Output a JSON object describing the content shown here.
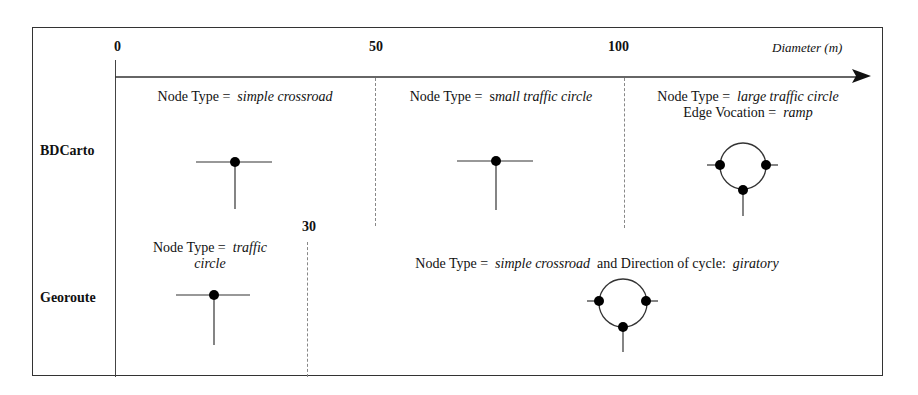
{
  "axis": {
    "title": "Diameter (m)",
    "ticks": [
      {
        "label": "0"
      },
      {
        "label": "50"
      },
      {
        "label": "100"
      }
    ],
    "georoute_threshold": "30"
  },
  "rows": [
    {
      "label": "BDCarto",
      "cells": [
        {
          "prefix": "Node Type =",
          "value": "simple crossroad",
          "icon": "simple-crossroad-node"
        },
        {
          "prefix": "Node Type =",
          "value_plain": "s",
          "value": "mall traffic circle",
          "icon": "simple-crossroad-node"
        },
        {
          "prefix": "Node Type =",
          "value": "large traffic circle",
          "line2_prefix": "Edge Vocation =",
          "line2_value": "ramp",
          "icon": "traffic-circle-cycle"
        }
      ]
    },
    {
      "label": "Georoute",
      "cells": [
        {
          "prefix": "Node Type =",
          "value": "traffic",
          "value_line2": "circle",
          "icon": "simple-crossroad-node"
        },
        {
          "prefix": "Node Type =",
          "value": "simple crossroad",
          "connector": "and Direction of cycle:",
          "value2": "giratory",
          "icon": "traffic-circle-cycle"
        }
      ]
    }
  ],
  "colors": {
    "line": "#333333",
    "node": "#000000",
    "divider": "#888888"
  }
}
